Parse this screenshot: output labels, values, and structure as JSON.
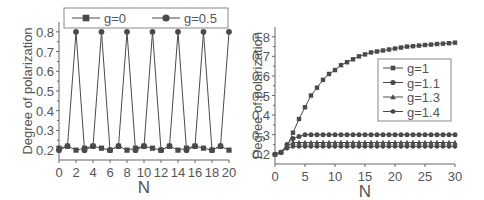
{
  "chart_data": [
    {
      "type": "line",
      "title": "",
      "xlabel": "N",
      "ylabel": "Degree of polarization",
      "xlim": [
        0,
        20
      ],
      "ylim": [
        0.15,
        0.85
      ],
      "xticks": [
        "0",
        "2",
        "4",
        "6",
        "8",
        "10",
        "12",
        "14",
        "16",
        "18",
        "20"
      ],
      "yticks": [
        "0.2",
        "0.3",
        "0.4",
        "0.5",
        "0.6",
        "0.7",
        "0.8"
      ],
      "legend_position": "top (outside, above plot)",
      "grid": false,
      "x": [
        0,
        1,
        2,
        3,
        4,
        5,
        6,
        7,
        8,
        9,
        10,
        11,
        12,
        13,
        14,
        15,
        16,
        17,
        18,
        19,
        20
      ],
      "series": [
        {
          "name": "g=0",
          "marker": "square",
          "values": [
            0.21,
            0.22,
            0.2,
            0.21,
            0.22,
            0.21,
            0.2,
            0.22,
            0.2,
            0.21,
            0.22,
            0.21,
            0.2,
            0.22,
            0.2,
            0.21,
            0.22,
            0.21,
            0.2,
            0.22,
            0.2
          ]
        },
        {
          "name": "g=0.5",
          "marker": "circle",
          "values": [
            0.2,
            0.22,
            0.8,
            0.2,
            0.22,
            0.8,
            0.2,
            0.22,
            0.8,
            0.2,
            0.22,
            0.8,
            0.2,
            0.22,
            0.8,
            0.2,
            0.22,
            0.8,
            0.2,
            0.22,
            0.8
          ]
        }
      ]
    },
    {
      "type": "line",
      "title": "",
      "xlabel": "N",
      "ylabel": "Degree of polarization",
      "xlim": [
        0,
        30
      ],
      "ylim": [
        0.15,
        0.85
      ],
      "xticks": [
        "0",
        "5",
        "10",
        "15",
        "20",
        "25",
        "30"
      ],
      "yticks": [
        "0.2",
        "0.3",
        "0.4",
        "0.5",
        "0.6",
        "0.7",
        "0.8"
      ],
      "legend_position": "center right (inside)",
      "grid": false,
      "x": [
        0,
        1,
        2,
        3,
        4,
        5,
        6,
        7,
        8,
        9,
        10,
        11,
        12,
        13,
        14,
        15,
        16,
        17,
        18,
        19,
        20,
        21,
        22,
        23,
        24,
        25,
        26,
        27,
        28,
        29,
        30
      ],
      "series": [
        {
          "name": "g=1",
          "marker": "square",
          "values": [
            0.2,
            0.21,
            0.24,
            0.31,
            0.38,
            0.44,
            0.5,
            0.54,
            0.58,
            0.61,
            0.63,
            0.655,
            0.67,
            0.685,
            0.7,
            0.71,
            0.72,
            0.725,
            0.73,
            0.735,
            0.74,
            0.745,
            0.75,
            0.752,
            0.755,
            0.758,
            0.76,
            0.763,
            0.765,
            0.767,
            0.77
          ]
        },
        {
          "name": "g=1.1",
          "marker": "circle",
          "values": [
            0.2,
            0.21,
            0.25,
            0.28,
            0.29,
            0.3,
            0.3,
            0.3,
            0.3,
            0.3,
            0.3,
            0.3,
            0.3,
            0.3,
            0.3,
            0.3,
            0.3,
            0.3,
            0.3,
            0.3,
            0.3,
            0.3,
            0.3,
            0.3,
            0.3,
            0.3,
            0.3,
            0.3,
            0.3,
            0.3,
            0.3
          ]
        },
        {
          "name": "g=1.3",
          "marker": "triangle",
          "values": [
            0.2,
            0.21,
            0.24,
            0.26,
            0.26,
            0.26,
            0.26,
            0.26,
            0.26,
            0.26,
            0.26,
            0.26,
            0.26,
            0.26,
            0.26,
            0.26,
            0.26,
            0.26,
            0.26,
            0.26,
            0.26,
            0.26,
            0.26,
            0.26,
            0.26,
            0.26,
            0.26,
            0.26,
            0.26,
            0.26,
            0.26
          ]
        },
        {
          "name": "g=1.4",
          "marker": "hexagon",
          "values": [
            0.2,
            0.21,
            0.23,
            0.24,
            0.24,
            0.24,
            0.24,
            0.24,
            0.24,
            0.24,
            0.24,
            0.24,
            0.24,
            0.24,
            0.24,
            0.24,
            0.24,
            0.24,
            0.24,
            0.24,
            0.24,
            0.24,
            0.24,
            0.24,
            0.24,
            0.24,
            0.24,
            0.24,
            0.24,
            0.24,
            0.24
          ]
        }
      ]
    }
  ],
  "colors": {
    "line": "#4a4a4a",
    "axis": "#666666",
    "text": "#555555"
  }
}
